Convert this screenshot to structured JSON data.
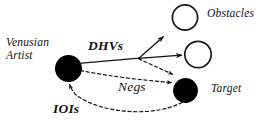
{
  "diagram": {
    "colors": {
      "ink": "#121212",
      "stroke": "#1a1a1a",
      "fill_solid": "#000000",
      "fill_hollow": "#ffffff",
      "background": "#ffffff"
    },
    "nodes": [
      {
        "id": "venusian-artist",
        "label": "Venusian\nArtist",
        "label_line1": "Venusian",
        "label_line2": "Artist",
        "shape": "circle",
        "fill": "solid",
        "cx": 68.5,
        "cy": 68.5,
        "r": 13.5
      },
      {
        "id": "obstacle-top",
        "label": "Obstacles",
        "shape": "circle",
        "fill": "hollow",
        "cx": 185,
        "cy": 17.5,
        "r": 13
      },
      {
        "id": "obstacle-middle",
        "label": "",
        "shape": "circle",
        "fill": "hollow",
        "cx": 198,
        "cy": 54.5,
        "r": 13.5
      },
      {
        "id": "target",
        "label": "Target",
        "shape": "circle",
        "fill": "solid",
        "cx": 185.5,
        "cy": 90.5,
        "r": 12.5
      }
    ],
    "edges": [
      {
        "id": "dhvs-trunk",
        "label": "DHVs",
        "style": "solid",
        "from": "venusian-artist",
        "to": "fan-point",
        "arrow": false
      },
      {
        "id": "dhv-ray-upper",
        "label": "",
        "style": "solid",
        "from": "fan-point",
        "to": "obstacle-top",
        "arrow": true
      },
      {
        "id": "dhv-ray-middle",
        "label": "",
        "style": "solid",
        "from": "fan-point",
        "to": "obstacle-middle",
        "arrow": true
      },
      {
        "id": "dhv-ray-lower",
        "label": "",
        "style": "dashed",
        "from": "fan-point",
        "to": "target",
        "arrow": true
      },
      {
        "id": "negs-curve",
        "label": "Negs",
        "style": "dashed",
        "from": "venusian-artist",
        "to": "target",
        "arrow": true
      },
      {
        "id": "iois-curve",
        "label": "IOIs",
        "style": "dashed",
        "from": "target",
        "to": "venusian-artist",
        "arrow": true
      }
    ],
    "labels": {
      "actor_line1": "Venusian",
      "actor_line2": "Artist",
      "dhvs": "DHVs",
      "negs": "Negs",
      "iois": "IOIs",
      "obstacles": "Obstacles",
      "target": "Target"
    }
  }
}
